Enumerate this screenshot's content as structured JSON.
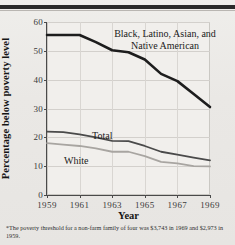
{
  "chart_data": {
    "type": "line",
    "title": "",
    "xlabel": "Year",
    "ylabel": "Percentage below poverty level",
    "xlim": [
      1959,
      1969
    ],
    "ylim": [
      0,
      60
    ],
    "ytick_step": 10,
    "grid": true,
    "legend_position": "inline-annotations",
    "xticks": [
      "1959",
      "1961",
      "1963",
      "1965",
      "1967",
      "1969"
    ],
    "yticks": [
      "0",
      "10",
      "20",
      "30",
      "40",
      "50",
      "60"
    ],
    "x": [
      1959,
      1960,
      1961,
      1962,
      1963,
      1964,
      1965,
      1966,
      1967,
      1968,
      1969
    ],
    "series": [
      {
        "name": "Black, Latino, Asian, and Native American",
        "label_line1": "Black, Latino, Asian, and",
        "label_line2": "Native American",
        "color": "#1d1d1d",
        "width": 2.6,
        "values": [
          55.5,
          55.5,
          55.5,
          53.0,
          50.2,
          49.5,
          47.0,
          42.0,
          39.5,
          35.0,
          30.5
        ]
      },
      {
        "name": "Total",
        "label_line1": "Total",
        "color": "#4a4a4a",
        "width": 1.8,
        "values": [
          22.0,
          21.8,
          21.0,
          20.0,
          18.8,
          18.7,
          17.0,
          15.0,
          14.0,
          13.0,
          12.0
        ]
      },
      {
        "name": "White",
        "label_line1": "White",
        "color": "#a8a5a1",
        "width": 1.8,
        "values": [
          18.0,
          17.5,
          17.0,
          16.2,
          15.0,
          15.0,
          13.5,
          11.5,
          11.0,
          10.0,
          9.9
        ]
      }
    ]
  },
  "footnote": {
    "marker": "*",
    "text": "The poverty threshold for a non-farm family of four was  $3,743 in 1969 and $2,973 in 1959."
  }
}
